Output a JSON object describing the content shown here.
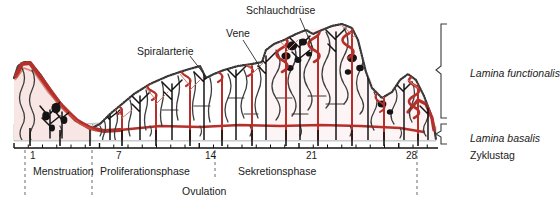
{
  "figure": {
    "title_absent": true,
    "colors": {
      "artery_red": "#b5302a",
      "gland_black": "#141414",
      "tissue_outline": "#3a3a3a",
      "basalis_gray": "#d8d9da",
      "stroma_fill": "#ffffff",
      "axis_black": "#111111",
      "text": "#1a1a1a"
    }
  },
  "callouts": [
    {
      "id": "spiralarterie",
      "label": "Spiralarterie",
      "x": 137,
      "y": 46,
      "lead_to_x": 207,
      "lead_to_y": 78
    },
    {
      "id": "vene",
      "label": "Vene",
      "x": 226,
      "y": 28,
      "lead_to_x": 262,
      "lead_to_y": 70
    },
    {
      "id": "schlauchdruese",
      "label": "Schlauchdrüse",
      "x": 246,
      "y": 5,
      "lead_to_x": 313,
      "lead_to_y": 48
    }
  ],
  "side_labels": [
    {
      "id": "lamina-functionalis",
      "label": "Lamina functionalis",
      "x": 470,
      "y": 68,
      "italic": true
    },
    {
      "id": "lamina-basalis",
      "label": "Lamina basalis",
      "x": 470,
      "y": 133,
      "italic": true
    },
    {
      "id": "zyklustag",
      "label": "Zyklustag",
      "x": 470,
      "y": 150,
      "italic": false
    }
  ],
  "axis": {
    "label": "Zyklustag",
    "x_start": 14,
    "x_end": 438,
    "y": 148,
    "px_per_day": 14.25,
    "day_of_first_tick": 1,
    "ticks": [
      1,
      2,
      3,
      4,
      5,
      6,
      7,
      8,
      9,
      10,
      11,
      12,
      13,
      14,
      15,
      16,
      17,
      18,
      19,
      20,
      21,
      22,
      23,
      24,
      25,
      26,
      27,
      28,
      29,
      30
    ],
    "labeled_ticks": [
      {
        "day": 1,
        "text": "1",
        "x": 30
      },
      {
        "day": 7,
        "text": "7",
        "x": 116
      },
      {
        "day": 14,
        "text": "14",
        "x": 205
      },
      {
        "day": 21,
        "text": "21",
        "x": 306
      },
      {
        "day": 28,
        "text": "28",
        "x": 406
      }
    ]
  },
  "phases": [
    {
      "id": "menstruation",
      "label": "Menstruation",
      "x": 33,
      "y": 165
    },
    {
      "id": "proliferationsphase",
      "label": "Proliferationsphase",
      "x": 100,
      "y": 165
    },
    {
      "id": "sekretionsphase",
      "label": "Sekretionsphase",
      "x": 238,
      "y": 165
    },
    {
      "id": "ovulation",
      "label": "Ovulation",
      "x": 182,
      "y": 185
    }
  ],
  "phase_dividers": [
    {
      "id": "divider-day1",
      "x": 25,
      "y_top": 150,
      "y_bottom": 198
    },
    {
      "id": "divider-day7",
      "x": 92,
      "y_top": 150,
      "y_bottom": 198
    },
    {
      "id": "divider-day14",
      "x": 215,
      "y_top": 150,
      "y_bottom": 180
    },
    {
      "id": "divider-day28",
      "x": 417,
      "y_top": 150,
      "y_bottom": 198
    }
  ],
  "chart_data": {
    "type": "area",
    "xlabel": "Zyklustag",
    "ylabel": "Schleimhautdicke",
    "xlim": [
      1,
      30
    ],
    "ylim": [
      0,
      100
    ],
    "grid": false,
    "legend": null,
    "x": [
      1,
      2,
      3,
      4,
      5,
      7,
      9,
      11,
      13,
      14,
      16,
      18,
      20,
      21,
      23,
      25,
      26,
      28,
      29,
      30
    ],
    "values": [
      88,
      78,
      58,
      40,
      26,
      22,
      34,
      46,
      56,
      62,
      72,
      80,
      92,
      96,
      88,
      84,
      76,
      58,
      48,
      44
    ],
    "annotations": [
      "Menstruation",
      "Proliferationsphase",
      "Ovulation",
      "Sekretionsphase"
    ]
  }
}
